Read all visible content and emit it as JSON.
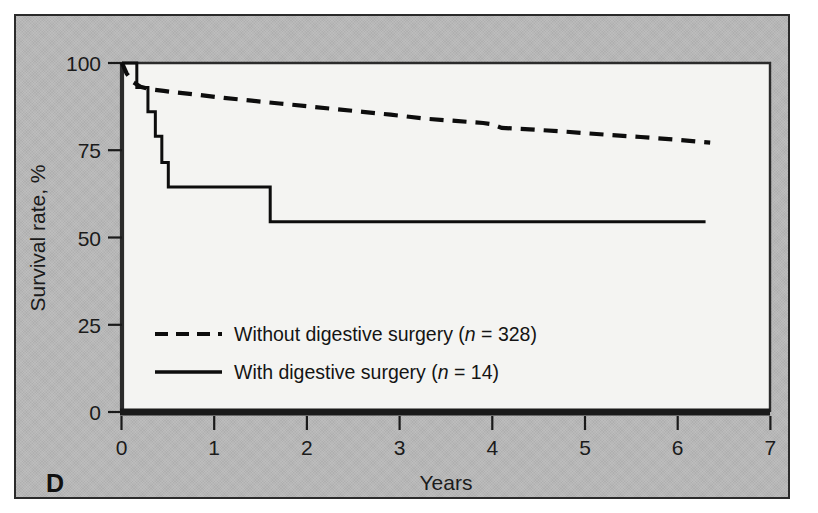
{
  "figure": {
    "panel_label": "D",
    "background_color": "#b7b7b7",
    "plot_background_color": "#f4f4f2",
    "border_color": "#2b2b2b",
    "line_color": "#0d0d0d"
  },
  "chart_data": {
    "type": "line",
    "title": "",
    "subtitle": "",
    "xlabel": "Years",
    "ylabel": "Survival rate, %",
    "xlim": [
      0,
      7
    ],
    "ylim": [
      0,
      100
    ],
    "xticks": [
      0,
      1,
      2,
      3,
      4,
      5,
      6,
      7
    ],
    "xticklabels": [
      "0",
      "1",
      "2",
      "3",
      "4",
      "5",
      "6",
      "7"
    ],
    "yticks": [
      0,
      25,
      50,
      75,
      100
    ],
    "yticklabels": [
      "0",
      "25",
      "50",
      "75",
      "100"
    ],
    "grid": false,
    "legend_position": "center-left",
    "annotations": [
      "D"
    ],
    "series": [
      {
        "name": "Without digestive surgery (n = 328)",
        "label_text": "Without digestive surgery (",
        "label_italic": "n",
        "label_tail": " = 328)",
        "style": "dashed",
        "n": 328,
        "x": [
          0.0,
          0.05,
          0.12,
          0.2,
          0.3,
          0.45,
          0.6,
          0.85,
          1.1,
          1.4,
          1.7,
          2.0,
          2.3,
          2.6,
          2.9,
          3.1,
          3.3,
          3.6,
          3.9,
          4.0,
          4.1,
          4.4,
          4.8,
          5.2,
          5.6,
          6.0,
          6.35
        ],
        "y": [
          100.0,
          97.0,
          94.5,
          93.2,
          92.5,
          92.0,
          91.5,
          90.8,
          90.0,
          89.2,
          88.4,
          87.6,
          86.8,
          86.0,
          85.2,
          84.6,
          84.0,
          83.4,
          82.8,
          82.4,
          81.4,
          81.0,
          80.3,
          79.5,
          78.8,
          78.0,
          77.2
        ],
        "endpoint_x": 6.35,
        "endpoint_y": 77.2
      },
      {
        "name": "With digestive surgery (n = 14)",
        "label_text": "With digestive surgery (",
        "label_italic": "n",
        "label_tail": " = 14)",
        "style": "solid",
        "n": 14,
        "step_x": [
          0.0,
          0.16,
          0.16,
          0.28,
          0.28,
          0.36,
          0.36,
          0.43,
          0.43,
          0.5,
          0.5,
          1.6,
          1.6,
          6.3
        ],
        "step_y": [
          100.0,
          100.0,
          93.0,
          93.0,
          86.0,
          86.0,
          79.0,
          79.0,
          71.5,
          71.5,
          64.5,
          64.5,
          54.5,
          54.5
        ],
        "drop_times": [
          0.16,
          0.28,
          0.36,
          0.43,
          0.5,
          1.6
        ],
        "plateau_values": [
          100.0,
          93.0,
          86.0,
          79.0,
          71.5,
          64.5,
          54.5
        ],
        "endpoint_x": 6.3,
        "endpoint_y": 54.5
      }
    ]
  },
  "legend": {
    "entries": [
      {
        "style": "dashed",
        "text_lead": "Without digestive surgery (",
        "text_italic": "n",
        "text_tail": " = 328)"
      },
      {
        "style": "solid",
        "text_lead": "With digestive surgery (",
        "text_italic": "n",
        "text_tail": " = 14)"
      }
    ]
  }
}
